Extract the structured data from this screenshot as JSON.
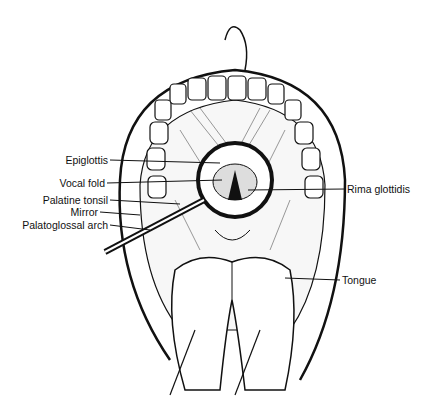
{
  "figure": {
    "labels_left": [
      {
        "text": "Epiglottis"
      },
      {
        "text": "Vocal fold"
      },
      {
        "text": "Palatine tonsil"
      },
      {
        "text": "Mirror"
      },
      {
        "text": "Palatoglossal arch"
      }
    ],
    "labels_right": [
      {
        "text": "Rima glottidis"
      },
      {
        "text": "Tongue"
      }
    ]
  }
}
